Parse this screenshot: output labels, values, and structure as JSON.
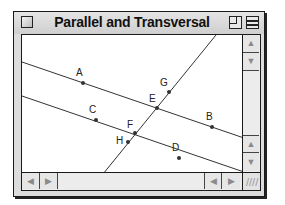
{
  "window": {
    "title": "Parallel and Transversal",
    "controls": {
      "close_icon": "close-box-icon",
      "zoom_icon": "zoom-box-icon",
      "collapse_icon": "windowshade-box-icon"
    }
  },
  "diagram": {
    "lines": [
      {
        "name": "line-AB",
        "x1": 0,
        "y1": 27,
        "x2": 222,
        "y2": 103
      },
      {
        "name": "line-CD",
        "x1": 0,
        "y1": 61,
        "x2": 222,
        "y2": 137
      },
      {
        "name": "transversal-GH",
        "x1": 194,
        "y1": 0,
        "x2": 81,
        "y2": 139
      }
    ],
    "points": {
      "A": {
        "label": "A",
        "x": 61,
        "y": 48,
        "lx": -7,
        "ly": -7
      },
      "B": {
        "label": "B",
        "x": 190,
        "y": 92,
        "lx": -6,
        "ly": -7
      },
      "C": {
        "label": "C",
        "x": 74,
        "y": 85,
        "lx": -7,
        "ly": -7
      },
      "D": {
        "label": "D",
        "x": 157,
        "y": 123,
        "lx": -7,
        "ly": -7
      },
      "E": {
        "label": "E",
        "x": 135,
        "y": 73,
        "lx": -8,
        "ly": -6
      },
      "F": {
        "label": "F",
        "x": 113,
        "y": 98,
        "lx": -8,
        "ly": -5
      },
      "G": {
        "label": "G",
        "x": 147,
        "y": 57,
        "lx": -9,
        "ly": -6
      },
      "H": {
        "label": "H",
        "x": 106,
        "y": 107,
        "lx": -12,
        "ly": 2
      }
    }
  },
  "scrollbars": {
    "vertical": {
      "up_arrow": "▲",
      "down_arrow": "▼"
    },
    "horizontal": {
      "left_arrow": "◀",
      "right_arrow": "▶"
    },
    "grow_box": "////"
  }
}
